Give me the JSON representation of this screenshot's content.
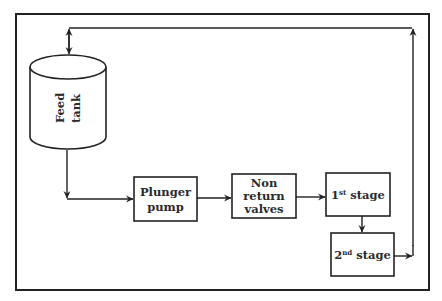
{
  "diagram": {
    "nodes": {
      "feed_tank": {
        "line1": "Feed",
        "line2": "tank"
      },
      "plunger_pump": {
        "line1": "Plunger",
        "line2": "pump"
      },
      "non_return": {
        "line1": "Non",
        "line2": "return",
        "line3": "valves"
      },
      "stage1": {
        "num": "1",
        "sup": "st",
        "text": " stage"
      },
      "stage2": {
        "num": "2",
        "sup": "nd",
        "text": " stage"
      }
    },
    "colors": {
      "stroke": "#222222",
      "background": "#ffffff"
    }
  }
}
